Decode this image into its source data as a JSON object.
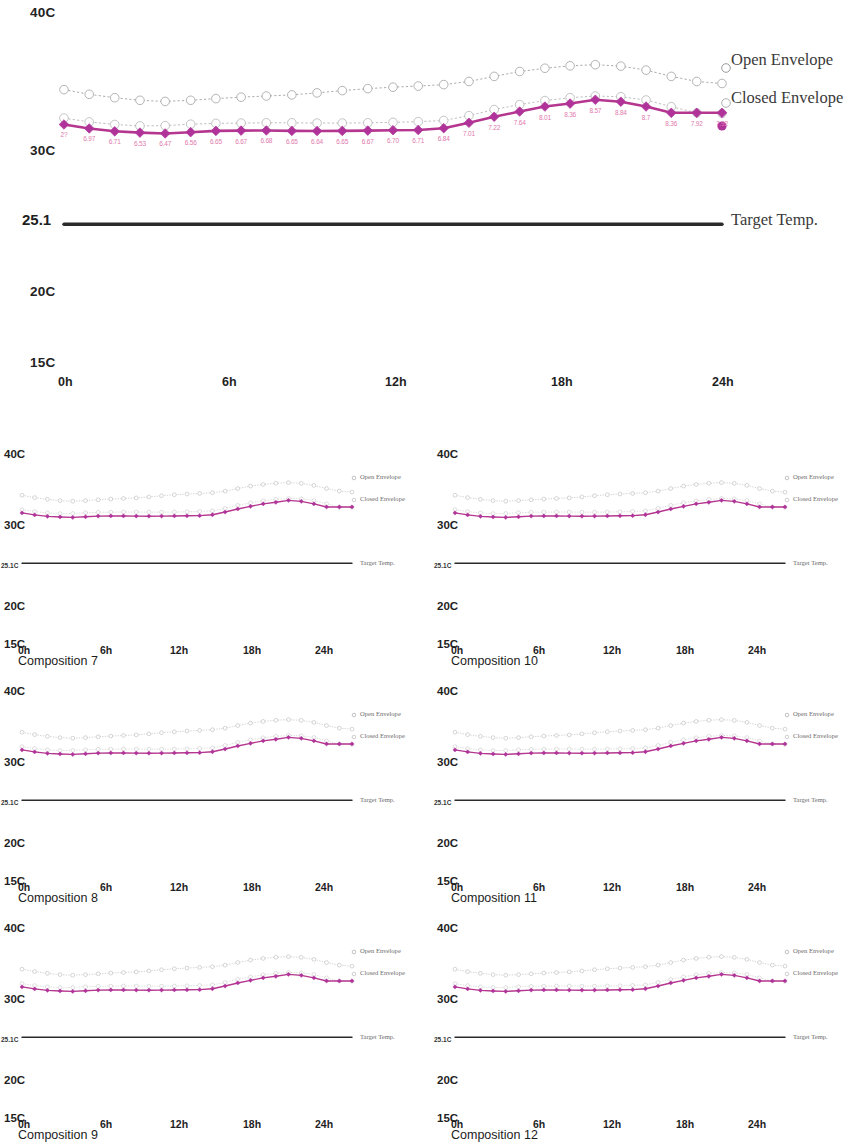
{
  "figure": {
    "type": "multi-panel-line-chart",
    "background": "#ffffff"
  },
  "colors": {
    "open_envelope": "#9a9a9a",
    "closed_envelope": "#b0b0b0",
    "main_series": "#b5368f",
    "main_series_marker": "#b0339a",
    "target_temp": "#2b2b2b",
    "point_label": "#e07aad"
  },
  "main": {
    "y_axis": {
      "labels": [
        "40C",
        "30C",
        "25.1",
        "20C",
        "15C"
      ],
      "values": [
        40,
        30,
        25.1,
        20,
        15
      ],
      "min": 15,
      "max": 40
    },
    "x_axis": {
      "labels": [
        "0h",
        "6h",
        "12h",
        "18h",
        "24h"
      ],
      "values": [
        0,
        6,
        12,
        18,
        24
      ],
      "min": 0,
      "max": 24
    },
    "legend": [
      {
        "label": "Open Envelope",
        "marker": "open-circle"
      },
      {
        "label": "Closed Envelope",
        "marker": "open-circle"
      },
      {
        "label": "Target Temp.",
        "marker": "solid-line"
      }
    ]
  },
  "chart_data": {
    "type": "line",
    "title": "",
    "xlabel": "",
    "ylabel": "",
    "xlim": [
      0,
      24
    ],
    "ylim": [
      15,
      40
    ],
    "grid": false,
    "legend_position": "right",
    "x": [
      0,
      0.92,
      1.85,
      2.77,
      3.69,
      4.62,
      5.54,
      6.46,
      7.38,
      8.31,
      9.23,
      10.15,
      11.08,
      12.0,
      12.92,
      13.85,
      14.77,
      15.69,
      16.62,
      17.54,
      18.46,
      19.38,
      20.31,
      21.23,
      22.15,
      23.08,
      24.0
    ],
    "xtick_labels": [
      "0h",
      "6h",
      "12h",
      "18h",
      "24h"
    ],
    "ytick_labels": [
      "40C",
      "30C",
      "25.1",
      "20C",
      "15C"
    ],
    "series": [
      {
        "name": "Open Envelope",
        "style": "dotted-open-marker",
        "color": "#9a9a9a",
        "values": [
          34.55,
          34.22,
          33.98,
          33.8,
          33.72,
          33.8,
          33.92,
          34.02,
          34.1,
          34.18,
          34.32,
          34.48,
          34.62,
          34.72,
          34.8,
          34.9,
          35.12,
          35.48,
          35.82,
          36.05,
          36.22,
          36.3,
          36.2,
          35.92,
          35.48,
          35.12,
          34.98
        ]
      },
      {
        "name": "Closed Envelope",
        "style": "dotted-open-marker",
        "color": "#b0b0b0",
        "values": [
          32.55,
          32.28,
          32.1,
          32.0,
          32.02,
          32.12,
          32.18,
          32.2,
          32.22,
          32.22,
          32.2,
          32.2,
          32.22,
          32.25,
          32.3,
          32.38,
          32.72,
          33.15,
          33.5,
          33.78,
          33.98,
          34.1,
          34.05,
          33.82,
          33.35,
          32.92,
          32.88
        ]
      },
      {
        "name": "Closed Envelope (measured)",
        "style": "solid-thick-diamond",
        "color": "#b5368f",
        "values": [
          32.1,
          31.82,
          31.62,
          31.53,
          31.47,
          31.56,
          31.65,
          31.67,
          31.68,
          31.65,
          31.64,
          31.65,
          31.67,
          31.7,
          31.71,
          31.84,
          32.22,
          32.64,
          33.01,
          33.36,
          33.57,
          33.84,
          33.7,
          33.36,
          32.92,
          32.92,
          32.92
        ],
        "point_labels": [
          "2?",
          "6.97",
          "6.71",
          "6.53",
          "6.47",
          "6.56",
          "6.65",
          "6.67",
          "6.68",
          "6.65",
          "6.64",
          "6.65",
          "6.67",
          "6.70",
          "6.71",
          "6.84",
          "7.01",
          "7.22",
          "7.64",
          "8.01",
          "8.36",
          "8.57",
          "8.84",
          "8.7",
          "8.36",
          "7.92",
          "7.92"
        ]
      },
      {
        "name": "Target Temp.",
        "style": "solid-flat",
        "color": "#2b2b2b",
        "values": [
          25.1,
          25.1,
          25.1,
          25.1,
          25.1,
          25.1,
          25.1,
          25.1,
          25.1,
          25.1,
          25.1,
          25.1,
          25.1,
          25.1,
          25.1,
          25.1,
          25.1,
          25.1,
          25.1,
          25.1,
          25.1,
          25.1,
          25.1,
          25.1,
          25.1,
          25.1,
          25.1
        ]
      }
    ]
  },
  "subplots": {
    "y_axis_labels": [
      "40C",
      "30C",
      "25.1C",
      "20C",
      "15C"
    ],
    "x_axis_labels": [
      "0h",
      "6h",
      "12h",
      "18h",
      "24h"
    ],
    "legend": [
      "Open Envelope",
      "Closed Envelope",
      "Target Temp."
    ],
    "panels": [
      {
        "caption": "Composition 7",
        "col": 0,
        "row": 0
      },
      {
        "caption": "Composition 10",
        "col": 1,
        "row": 0
      },
      {
        "caption": "Composition 8",
        "col": 0,
        "row": 1
      },
      {
        "caption": "Composition 11",
        "col": 1,
        "row": 1
      },
      {
        "caption": "Composition 9",
        "col": 0,
        "row": 2
      },
      {
        "caption": "Composition 12",
        "col": 1,
        "row": 2
      }
    ]
  }
}
